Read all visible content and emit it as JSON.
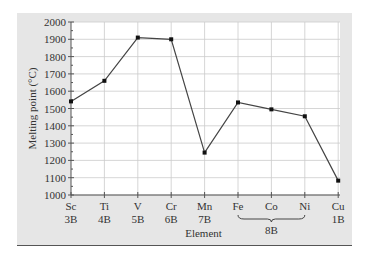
{
  "chart_data": {
    "type": "line",
    "title": "",
    "xlabel": "Element",
    "ylabel": "Melting point (°C)",
    "ylim": [
      1000,
      2000
    ],
    "yticks": [
      1000,
      1100,
      1200,
      1300,
      1400,
      1500,
      1600,
      1700,
      1800,
      1900,
      2000
    ],
    "categories": [
      "Sc",
      "Ti",
      "V",
      "Cr",
      "Mn",
      "Fe",
      "Co",
      "Ni",
      "Cu"
    ],
    "groups": [
      "3B",
      "4B",
      "5B",
      "6B",
      "7B",
      "8B",
      "8B",
      "8B",
      "1B"
    ],
    "group_bracket": {
      "label": "8B",
      "from": "Fe",
      "to": "Ni"
    },
    "values": [
      1541,
      1660,
      1910,
      1900,
      1245,
      1535,
      1495,
      1455,
      1083
    ],
    "grid": true,
    "legend": null,
    "colors": {
      "panel": "#e6e6e6",
      "plot_bg": "#ffffff",
      "line": "#444444",
      "marker": "#111111",
      "grid": "#cccccc"
    }
  }
}
